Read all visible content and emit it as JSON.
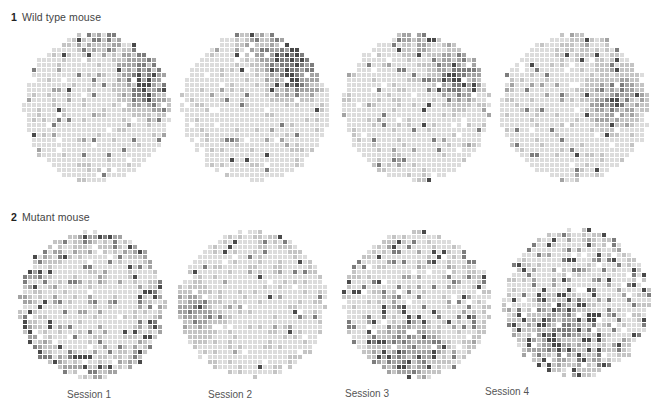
{
  "figure": {
    "rows": [
      {
        "number": "1",
        "label": "Wild type mouse",
        "panels": [
          {
            "session": "Session 1",
            "seed": 11,
            "hotspot": {
              "cx": 0.85,
              "cy": 0.35,
              "r": 0.3,
              "strength": 0.85
            },
            "top_band": 0.55,
            "noise": 0.05
          },
          {
            "session": "Session 2",
            "seed": 23,
            "hotspot": {
              "cx": 0.78,
              "cy": 0.25,
              "r": 0.32,
              "strength": 0.85
            },
            "top_band": 0.6,
            "noise": 0.05
          },
          {
            "session": "Session 3",
            "seed": 37,
            "hotspot": {
              "cx": 0.8,
              "cy": 0.3,
              "r": 0.3,
              "strength": 0.75
            },
            "top_band": 0.45,
            "noise": 0.08
          },
          {
            "session": "Session 4",
            "seed": 41,
            "hotspot": {
              "cx": 0.78,
              "cy": 0.45,
              "r": 0.32,
              "strength": 0.7
            },
            "top_band": 0.4,
            "noise": 0.08
          }
        ]
      },
      {
        "number": "2",
        "label": "Mutant mouse",
        "panels": [
          {
            "session": "Session 1",
            "seed": 53,
            "hotspot": {
              "cx": 0.5,
              "cy": 0.5,
              "r": 0.0,
              "strength": 0.0
            },
            "rim": 0.35,
            "noise": 0.18
          },
          {
            "session": "Session 2",
            "seed": 67,
            "hotspot": {
              "cx": 0.15,
              "cy": 0.55,
              "r": 0.25,
              "strength": 0.55
            },
            "rim": 0.15,
            "noise": 0.05
          },
          {
            "session": "Session 3",
            "seed": 71,
            "hotspot": {
              "cx": 0.45,
              "cy": 0.8,
              "r": 0.35,
              "strength": 0.65
            },
            "rim": 0.15,
            "noise": 0.2
          },
          {
            "session": "Session 4",
            "seed": 89,
            "hotspot": {
              "cx": 0.4,
              "cy": 0.7,
              "r": 0.4,
              "strength": 0.6
            },
            "rim": 0.15,
            "noise": 0.25
          }
        ]
      }
    ],
    "grid": {
      "cells": 30,
      "pitch": 5,
      "square": 4
    },
    "palette": [
      "#dcdcdc",
      "#c4c4c4",
      "#a3a3a3",
      "#7d7d7d",
      "#4a4a4a"
    ]
  }
}
